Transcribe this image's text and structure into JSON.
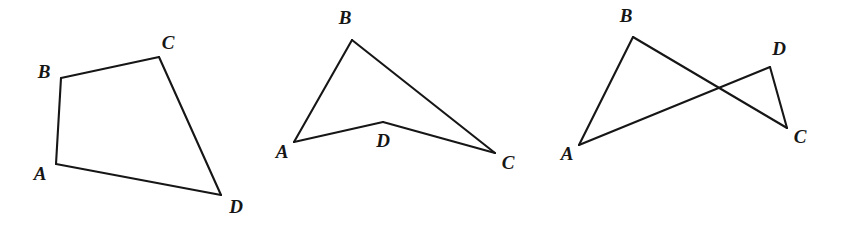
{
  "diagram": {
    "canvas": {
      "width": 844,
      "height": 228
    },
    "style": {
      "background_color": "#ffffff",
      "stroke_color": "#161616",
      "stroke_width": 2.1,
      "label_color": "#161616",
      "label_font_size": 19
    },
    "figures": [
      {
        "name": "convex-quadrilateral",
        "kind": "simple convex quadrilateral",
        "closed": true,
        "vertices": [
          {
            "label": "A",
            "x": 56,
            "y": 164,
            "label_x": 40,
            "label_y": 173
          },
          {
            "label": "B",
            "x": 61,
            "y": 78,
            "label_x": 44,
            "label_y": 71
          },
          {
            "label": "C",
            "x": 159,
            "y": 57,
            "label_x": 168,
            "label_y": 42
          },
          {
            "label": "D",
            "x": 221,
            "y": 195,
            "label_x": 236,
            "label_y": 206
          }
        ],
        "edges": [
          [
            0,
            1
          ],
          [
            1,
            2
          ],
          [
            2,
            3
          ],
          [
            3,
            0
          ]
        ]
      },
      {
        "name": "concave-quadrilateral",
        "kind": "simple concave (non-convex) quadrilateral",
        "closed": true,
        "vertices": [
          {
            "label": "A",
            "x": 294,
            "y": 142,
            "label_x": 282,
            "label_y": 151
          },
          {
            "label": "B",
            "x": 352,
            "y": 40,
            "label_x": 345,
            "label_y": 17
          },
          {
            "label": "C",
            "x": 495,
            "y": 153,
            "label_x": 508,
            "label_y": 162
          },
          {
            "label": "D",
            "x": 383,
            "y": 122,
            "label_x": 383,
            "label_y": 140
          }
        ],
        "edges": [
          [
            0,
            1
          ],
          [
            1,
            2
          ],
          [
            2,
            3
          ],
          [
            3,
            0
          ]
        ]
      },
      {
        "name": "crossed-quadrilateral",
        "kind": "self-intersecting (crossed) quadrilateral",
        "closed": true,
        "vertices": [
          {
            "label": "A",
            "x": 579,
            "y": 145,
            "label_x": 567,
            "label_y": 153
          },
          {
            "label": "B",
            "x": 633,
            "y": 37,
            "label_x": 626,
            "label_y": 15
          },
          {
            "label": "C",
            "x": 787,
            "y": 128,
            "label_x": 800,
            "label_y": 136
          },
          {
            "label": "D",
            "x": 770,
            "y": 67,
            "label_x": 779,
            "label_y": 48
          }
        ],
        "edges": [
          [
            0,
            1
          ],
          [
            1,
            2
          ],
          [
            2,
            3
          ],
          [
            3,
            0
          ]
        ],
        "intersection": {
          "x": 719,
          "y": 86
        }
      }
    ]
  }
}
